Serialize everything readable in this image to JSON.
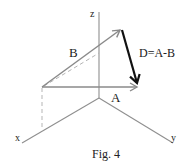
{
  "figure": {
    "caption": "Fig. 4",
    "axes": {
      "x_label": "x",
      "y_label": "y",
      "z_label": "z"
    },
    "vectors": {
      "A": {
        "label": "A",
        "color": "#8a8a8a"
      },
      "B": {
        "label": "B",
        "color": "#8a8a8a"
      },
      "D": {
        "label": "D=A-B",
        "color": "#111111"
      }
    },
    "colors": {
      "axis": "#8f8f8f",
      "dashed": "#b5b5b5",
      "text": "#222222"
    }
  }
}
